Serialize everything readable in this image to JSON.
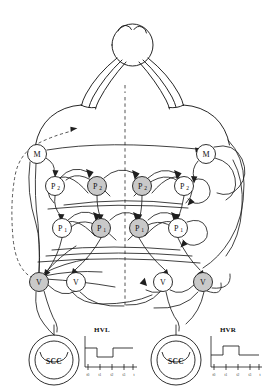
{
  "figure": {
    "background_color": "#ffffff",
    "ink_color": "#1a1a1a",
    "node_fill_active": "#c9c9c9",
    "node_fill_inactive": "#ffffff",
    "width": 264,
    "height": 389
  },
  "midline": {
    "name": "body-midline",
    "style": "dashed",
    "x": 125,
    "y_top": 97,
    "y_bottom": 307
  },
  "body": {
    "head_label": "",
    "wings": 2,
    "description": "dorsal schematic of head with paired lateral appendages"
  },
  "layers": [
    {
      "id": "M",
      "label": "M",
      "sub": "",
      "y": 154
    },
    {
      "id": "P2",
      "label": "P",
      "sub": "2",
      "y": 186
    },
    {
      "id": "P1",
      "label": "P",
      "sub": "1",
      "y": 228
    },
    {
      "id": "V",
      "label": "V",
      "sub": "",
      "y": 282
    }
  ],
  "nodes": [
    {
      "id": "M-L",
      "layer": "M",
      "label": "M",
      "sub": "",
      "x": 37,
      "y": 154,
      "r": 9.5,
      "state": "inactive",
      "side": "left"
    },
    {
      "id": "M-R",
      "layer": "M",
      "label": "M",
      "sub": "",
      "x": 206,
      "y": 154,
      "r": 9.5,
      "state": "inactive",
      "side": "right"
    },
    {
      "id": "P2-L2",
      "layer": "P2",
      "label": "P",
      "sub": "2",
      "x": 55,
      "y": 186,
      "r": 9.5,
      "state": "inactive",
      "side": "left"
    },
    {
      "id": "P2-L1",
      "layer": "P2",
      "label": "P",
      "sub": "2",
      "x": 97,
      "y": 186,
      "r": 9.5,
      "state": "active",
      "side": "left"
    },
    {
      "id": "P2-R1",
      "layer": "P2",
      "label": "P",
      "sub": "2",
      "x": 142,
      "y": 186,
      "r": 9.5,
      "state": "active",
      "side": "right"
    },
    {
      "id": "P2-R2",
      "layer": "P2",
      "label": "P",
      "sub": "2",
      "x": 184,
      "y": 186,
      "r": 9.5,
      "state": "inactive",
      "side": "right"
    },
    {
      "id": "P1-L2",
      "layer": "P1",
      "label": "P",
      "sub": "1",
      "x": 62,
      "y": 228,
      "r": 9.5,
      "state": "inactive",
      "side": "left"
    },
    {
      "id": "P1-L1",
      "layer": "P1",
      "label": "P",
      "sub": "1",
      "x": 101,
      "y": 228,
      "r": 9.5,
      "state": "active",
      "side": "left"
    },
    {
      "id": "P1-R1",
      "layer": "P1",
      "label": "P",
      "sub": "1",
      "x": 139,
      "y": 228,
      "r": 9.5,
      "state": "active",
      "side": "right"
    },
    {
      "id": "P1-R2",
      "layer": "P1",
      "label": "P",
      "sub": "1",
      "x": 178,
      "y": 228,
      "r": 9.5,
      "state": "inactive",
      "side": "right"
    },
    {
      "id": "V-L2",
      "layer": "V",
      "label": "V",
      "sub": "",
      "x": 39,
      "y": 282,
      "r": 9.5,
      "state": "active",
      "side": "left"
    },
    {
      "id": "V-L1",
      "layer": "V",
      "label": "V",
      "sub": "",
      "x": 76,
      "y": 282,
      "r": 9.5,
      "state": "inactive",
      "side": "left"
    },
    {
      "id": "V-R1",
      "layer": "V",
      "label": "V",
      "sub": "",
      "x": 163,
      "y": 282,
      "r": 9.5,
      "state": "inactive",
      "side": "right"
    },
    {
      "id": "V-R2",
      "layer": "V",
      "label": "V",
      "sub": "",
      "x": 203,
      "y": 282,
      "r": 9.5,
      "state": "active",
      "side": "right"
    }
  ],
  "organs": [
    {
      "id": "scc-left",
      "label": "SCC",
      "cx": 54,
      "cy": 360,
      "r_outer": 25,
      "r_inner": 19,
      "side": "left"
    },
    {
      "id": "scc-right",
      "label": "SCC",
      "cx": 176,
      "cy": 360,
      "r_outer": 25,
      "r_inner": 19,
      "side": "right"
    }
  ],
  "waveforms": [
    {
      "id": "hvl",
      "title": "HVL",
      "side": "left",
      "description": "head velocity left: step decrease then return to baseline",
      "x_ticks": [
        "t0",
        "t1",
        "t2",
        "t3",
        "t"
      ],
      "baseline": 0,
      "levels": [
        0,
        -1,
        -1,
        0
      ],
      "segments": [
        {
          "from": "t0",
          "to": "t1",
          "level": 0
        },
        {
          "from": "t1",
          "to": "t2",
          "level": -1
        },
        {
          "from": "t2",
          "to": "t",
          "level": 0
        }
      ]
    },
    {
      "id": "hvr",
      "title": "HVR",
      "side": "right",
      "description": "head velocity right: step increase then return to baseline",
      "x_ticks": [
        "t0",
        "t1",
        "t2",
        "t3",
        "t"
      ],
      "baseline": 0,
      "levels": [
        0,
        1,
        1,
        0
      ],
      "segments": [
        {
          "from": "t0",
          "to": "t1",
          "level": 0
        },
        {
          "from": "t1",
          "to": "t2",
          "level": 1
        },
        {
          "from": "t2",
          "to": "t",
          "level": 0
        }
      ]
    }
  ],
  "legend": {
    "active_meaning": "shaded node",
    "inactive_meaning": "open node"
  }
}
